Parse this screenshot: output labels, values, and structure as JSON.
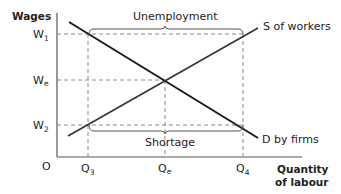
{
  "diagram": {
    "type": "labour-market-supply-demand",
    "y_axis_label": "Wages",
    "x_axis_label_line1": "Quantity",
    "x_axis_label_line2": "of labour",
    "origin_label": "O",
    "y_ticks": [
      {
        "base": "W",
        "sub": "1"
      },
      {
        "base": "W",
        "sub": "e"
      },
      {
        "base": "W",
        "sub": "2"
      }
    ],
    "x_ticks": [
      {
        "base": "Q",
        "sub": "3"
      },
      {
        "base": "Q",
        "sub": "e"
      },
      {
        "base": "Q",
        "sub": "4"
      }
    ],
    "curves": {
      "supply": "S of workers",
      "demand": "D by firms"
    },
    "annotations": {
      "top_bracket": "Unemployment",
      "bottom_bracket": "Shortage"
    },
    "colors": {
      "line": "#1a1a1a",
      "axis": "#555555",
      "dashed": "#8a8a8a",
      "text": "#222222"
    }
  }
}
